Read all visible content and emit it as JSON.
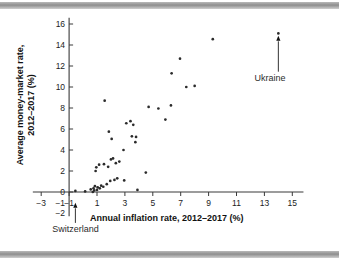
{
  "chart_data": {
    "type": "scatter",
    "title": "",
    "xlabel": "Annual inflation rate, 2012–2017 (%)",
    "ylabel": "Average money-market rate, 2012–2017 (%)",
    "xlim": [
      -3.6,
      15.8
    ],
    "ylim": [
      -2.6,
      16.6
    ],
    "xticks": [
      -3,
      -1,
      1,
      3,
      5,
      7,
      9,
      11,
      13,
      15
    ],
    "xticklabels": [
      "−3",
      "−1",
      "1",
      "3",
      "5",
      "7",
      "9",
      "11",
      "13",
      "15"
    ],
    "yticks": [
      0,
      2,
      4,
      6,
      8,
      10,
      12,
      14,
      16
    ],
    "yticklabels": [
      "0",
      "2",
      "4",
      "6",
      "8",
      "10",
      "12",
      "14",
      "16"
    ],
    "extra_yticklabels": [
      {
        "value": -1,
        "label": "−1"
      },
      {
        "value": -2,
        "label": "−2"
      }
    ],
    "grid": false,
    "legend": null,
    "marker_color": "#2b2b2b",
    "axis_color": "#3a3a3a",
    "points": [
      {
        "x": -0.55,
        "y": 0.1
      },
      {
        "x": 0.15,
        "y": 0.05
      },
      {
        "x": 0.55,
        "y": 0.25
      },
      {
        "x": 0.7,
        "y": 0.0
      },
      {
        "x": 0.75,
        "y": 0.35
      },
      {
        "x": 0.8,
        "y": 0.15
      },
      {
        "x": 0.85,
        "y": 0.55
      },
      {
        "x": 0.9,
        "y": 2.0
      },
      {
        "x": 0.95,
        "y": 2.35
      },
      {
        "x": 1.0,
        "y": 0.2
      },
      {
        "x": 1.05,
        "y": 0.45
      },
      {
        "x": 1.15,
        "y": 2.6
      },
      {
        "x": 1.2,
        "y": 0.35
      },
      {
        "x": 1.3,
        "y": 0.6
      },
      {
        "x": 1.45,
        "y": 0.5
      },
      {
        "x": 1.5,
        "y": 2.65
      },
      {
        "x": 1.55,
        "y": 8.7
      },
      {
        "x": 1.7,
        "y": 0.75
      },
      {
        "x": 1.8,
        "y": 2.4
      },
      {
        "x": 1.85,
        "y": 5.75
      },
      {
        "x": 1.95,
        "y": 1.05
      },
      {
        "x": 2.0,
        "y": 3.1
      },
      {
        "x": 2.05,
        "y": 5.05
      },
      {
        "x": 2.15,
        "y": 3.2
      },
      {
        "x": 2.25,
        "y": 1.15
      },
      {
        "x": 2.35,
        "y": 2.75
      },
      {
        "x": 2.45,
        "y": 1.3
      },
      {
        "x": 2.6,
        "y": 2.9
      },
      {
        "x": 2.9,
        "y": 4.0
      },
      {
        "x": 2.95,
        "y": 1.1
      },
      {
        "x": 3.1,
        "y": 6.55
      },
      {
        "x": 3.4,
        "y": 6.75
      },
      {
        "x": 3.5,
        "y": 5.3
      },
      {
        "x": 3.6,
        "y": 6.4
      },
      {
        "x": 3.75,
        "y": 4.75
      },
      {
        "x": 3.8,
        "y": 5.25
      },
      {
        "x": 3.9,
        "y": 0.2
      },
      {
        "x": 4.5,
        "y": 1.85
      },
      {
        "x": 4.7,
        "y": 8.1
      },
      {
        "x": 5.4,
        "y": 7.95
      },
      {
        "x": 5.9,
        "y": 6.9
      },
      {
        "x": 6.3,
        "y": 8.25
      },
      {
        "x": 6.35,
        "y": 11.3
      },
      {
        "x": 6.95,
        "y": 12.7
      },
      {
        "x": 7.4,
        "y": 10.0
      },
      {
        "x": 8.0,
        "y": 10.1
      },
      {
        "x": 9.3,
        "y": 14.55
      },
      {
        "x": 14.0,
        "y": 15.1
      }
    ],
    "annotations": [
      {
        "label": "Switzerland",
        "marker": "triangle-up",
        "x": -0.55,
        "y": -1.5,
        "label_x": -2.2,
        "label_y": -3.8
      },
      {
        "label": "Ukraine",
        "marker": "triangle-up",
        "x": 14.0,
        "y": 14.4,
        "label_x": 13.4,
        "label_y": 10.6
      }
    ]
  }
}
